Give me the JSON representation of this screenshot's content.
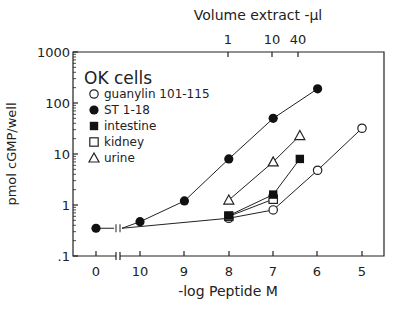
{
  "chart_data": {
    "type": "line",
    "title": "",
    "xlabel": "-log Peptide M",
    "x2label": "Volume extract -µl",
    "ylabel": "pmol cGMP/well",
    "yscale": "log",
    "ylim": [
      0.1,
      1000
    ],
    "yticks": [
      "1000",
      "100",
      "10",
      "1",
      ".1"
    ],
    "xticks": [
      "0",
      "10",
      "9",
      "8",
      "7",
      "6",
      "5"
    ],
    "x2ticks": [
      "1",
      "10",
      "40"
    ],
    "axis_break": "between 0 and 10",
    "legend_title": "OK cells",
    "legend_position": "upper left",
    "grid": false,
    "series": [
      {
        "name": "guanylin 101-115",
        "marker": "open-circle",
        "x": [
          8,
          7,
          6,
          5
        ],
        "values": [
          0.55,
          0.8,
          4.8,
          32
        ]
      },
      {
        "name": "ST 1-18",
        "marker": "filled-circle",
        "x": [
          "0",
          10,
          9,
          8,
          7,
          6
        ],
        "values": [
          0.35,
          0.47,
          1.2,
          8,
          50,
          190
        ]
      },
      {
        "name": "intestine",
        "marker": "filled-square",
        "x": [
          8,
          7,
          6.4
        ],
        "values": [
          0.62,
          1.6,
          8
        ]
      },
      {
        "name": "kidney",
        "marker": "open-square",
        "x": [
          8,
          7
        ],
        "values": [
          0.6,
          1.3
        ]
      },
      {
        "name": "urine",
        "marker": "open-triangle",
        "x": [
          8,
          7,
          6.4
        ],
        "values": [
          1.25,
          7,
          23
        ]
      }
    ]
  },
  "labels": {
    "legend_title": "OK cells",
    "legend": [
      "guanylin 101-115",
      "ST 1-18",
      "intestine",
      "kidney",
      "urine"
    ],
    "xlabel": "-log Peptide M",
    "x2label": "Volume extract -µl",
    "ylabel": "pmol cGMP/well"
  }
}
